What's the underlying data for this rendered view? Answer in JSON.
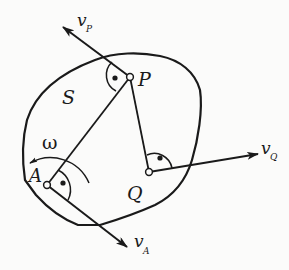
{
  "figure": {
    "body_label": "S",
    "omega_label": "ω",
    "points": [
      {
        "name": "P",
        "label": "P"
      },
      {
        "name": "A",
        "label": "A"
      },
      {
        "name": "Q",
        "label": "Q"
      }
    ],
    "vectors": [
      {
        "name": "v_P",
        "base": "v",
        "subscript": "P"
      },
      {
        "name": "v_A",
        "base": "v",
        "subscript": "A"
      },
      {
        "name": "v_Q",
        "base": "v",
        "subscript": "Q"
      }
    ],
    "colors": {
      "stroke": "#1a1a1a",
      "background": "#fbfbfa"
    }
  }
}
